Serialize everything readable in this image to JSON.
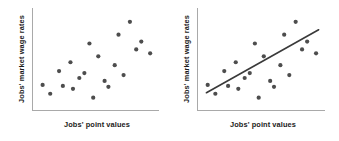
{
  "figure": {
    "background_color": "#ffffff",
    "panel_count": 2
  },
  "chart_data": [
    {
      "type": "scatter",
      "panel": "left",
      "title": "",
      "xlabel": "Jobs' point values",
      "ylabel": "Jobs' market wage rates",
      "xlim": [
        0,
        100
      ],
      "ylim": [
        0,
        100
      ],
      "grid": false,
      "legend": false,
      "axis_ticks": false,
      "trend_line": false,
      "point_color": "#4d4d4d",
      "axis_color": "#a9a9a9",
      "marker_size": 2.1,
      "x": [
        8,
        14,
        21,
        24,
        30,
        32,
        37,
        41,
        45,
        48,
        52,
        57,
        60,
        65,
        68,
        72,
        77,
        82,
        86,
        93
      ],
      "y": [
        26,
        17,
        40,
        25,
        49,
        22,
        33,
        38,
        68,
        13,
        55,
        30,
        24,
        46,
        77,
        36,
        90,
        62,
        70,
        58
      ]
    },
    {
      "type": "scatter",
      "panel": "right",
      "title": "",
      "xlabel": "Jobs' point values",
      "ylabel": "Jobs' market wage rates",
      "xlim": [
        0,
        100
      ],
      "ylim": [
        0,
        100
      ],
      "grid": false,
      "legend": false,
      "axis_ticks": false,
      "trend_line": true,
      "point_color": "#4d4d4d",
      "axis_color": "#a9a9a9",
      "trend_line_color": "#3a3a3a",
      "marker_size": 2.1,
      "x": [
        8,
        14,
        21,
        24,
        30,
        32,
        37,
        41,
        45,
        48,
        52,
        57,
        60,
        65,
        68,
        72,
        77,
        82,
        86,
        93
      ],
      "y": [
        26,
        17,
        40,
        25,
        49,
        22,
        33,
        38,
        68,
        13,
        55,
        30,
        24,
        46,
        77,
        36,
        90,
        62,
        70,
        58
      ],
      "trend": {
        "x_start": 7,
        "y_start": 18,
        "x_end": 95,
        "y_end": 82
      }
    }
  ]
}
